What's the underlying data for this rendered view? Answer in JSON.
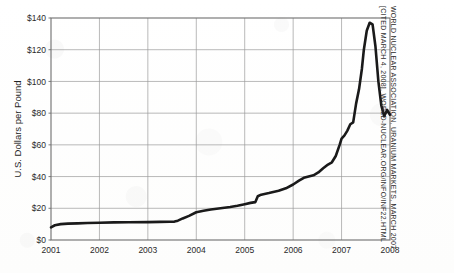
{
  "figure": {
    "kind": "line-chart",
    "background_hex": "#fefefe",
    "ink_hex": "#1a1a1a",
    "grid_hex": "#9a9a9a",
    "frame_hex": "#6e6e6e"
  },
  "citation": {
    "line1": "World Nuclear Association, Uranium Markets, March 2007.",
    "line2": "[cited March 4, 2008], world-nuclear.org/info/inf22.html"
  },
  "chart_data": {
    "type": "line",
    "title": "",
    "xlabel": "",
    "ylabel": "U.S. Dollars per Pound",
    "xlim": [
      2001,
      2008
    ],
    "ylim": [
      0,
      140
    ],
    "grid": true,
    "legend": "none",
    "x_tick_labels": [
      "2001",
      "2002",
      "2003",
      "2004",
      "2005",
      "2006",
      "2007",
      "2008"
    ],
    "x_tick_values": [
      2001,
      2002,
      2003,
      2004,
      2005,
      2006,
      2007,
      2008
    ],
    "y_tick_labels": [
      "$0",
      "$20",
      "$40",
      "$60",
      "$80",
      "$100",
      "$120",
      "$140"
    ],
    "y_tick_values": [
      0,
      20,
      40,
      60,
      80,
      100,
      120,
      140
    ],
    "series": [
      {
        "name": "Uranium spot price",
        "color": "#1a1a1a",
        "line_width": 2.6,
        "x": [
          2001.0,
          2001.08,
          2001.2,
          2001.35,
          2001.55,
          2001.75,
          2002.0,
          2002.3,
          2002.6,
          2003.0,
          2003.25,
          2003.45,
          2003.55,
          2003.62,
          2003.72,
          2003.85,
          2004.0,
          2004.15,
          2004.3,
          2004.5,
          2004.7,
          2004.85,
          2005.0,
          2005.12,
          2005.22,
          2005.27,
          2005.34,
          2005.5,
          2005.7,
          2005.85,
          2006.0,
          2006.12,
          2006.22,
          2006.32,
          2006.42,
          2006.52,
          2006.62,
          2006.72,
          2006.8,
          2006.88,
          2006.96,
          2007.0,
          2007.06,
          2007.12,
          2007.18,
          2007.24,
          2007.3,
          2007.36,
          2007.42,
          2007.46,
          2007.52,
          2007.58,
          2007.64,
          2007.7,
          2007.76,
          2007.82,
          2007.88,
          2007.94,
          2008.0
        ],
        "y": [
          8.0,
          9.3,
          10.0,
          10.3,
          10.5,
          10.7,
          10.9,
          11.1,
          11.2,
          11.3,
          11.4,
          11.5,
          11.6,
          12.2,
          13.6,
          15.2,
          17.5,
          18.4,
          19.2,
          20.0,
          20.8,
          21.6,
          22.6,
          23.4,
          23.9,
          27.6,
          28.6,
          29.6,
          31.0,
          32.6,
          35.0,
          37.4,
          39.2,
          40.0,
          40.8,
          42.6,
          45.2,
          47.6,
          49.0,
          53.0,
          60.0,
          64.0,
          66.0,
          69.0,
          73.0,
          74.2,
          86.0,
          95.0,
          108.0,
          120.0,
          132.0,
          137.0,
          136.0,
          122.0,
          100.0,
          85.0,
          78.0,
          82.0,
          79.0
        ]
      }
    ],
    "annotations": [
      {
        "label": "peak",
        "x": 2007.58,
        "y": 137.0
      },
      {
        "label": "post-peak trough",
        "x": 2007.88,
        "y": 78.0
      },
      {
        "label": "rebound",
        "x": 2007.96,
        "y": 95.0
      },
      {
        "label": "end",
        "x": 2008.0,
        "y": 79.0
      }
    ]
  }
}
